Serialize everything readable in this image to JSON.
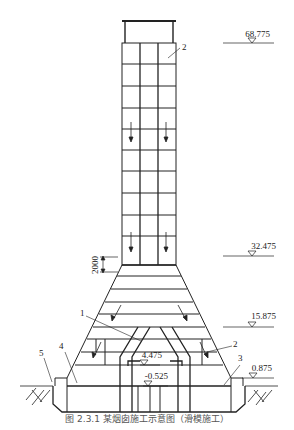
{
  "diagram": {
    "type": "chimney-section-elevation",
    "elevations": [
      {
        "id": "top",
        "label": "68.775"
      },
      {
        "id": "transition",
        "label": "32.475"
      },
      {
        "id": "mid",
        "label": "15.875"
      },
      {
        "id": "inner-top",
        "label": "4.475"
      },
      {
        "id": "ground",
        "label": "0.875"
      },
      {
        "id": "inner-bottom",
        "label": "-0.525"
      }
    ],
    "dimension": {
      "label": "2000"
    },
    "callouts": [
      {
        "id": "1",
        "label": "1"
      },
      {
        "id": "2a",
        "label": "2"
      },
      {
        "id": "2b",
        "label": "2"
      },
      {
        "id": "3",
        "label": "3"
      },
      {
        "id": "4",
        "label": "4"
      },
      {
        "id": "5",
        "label": "5"
      }
    ],
    "caption": "图 2.3.1 某烟囱施工示意图（滑模施工）"
  }
}
